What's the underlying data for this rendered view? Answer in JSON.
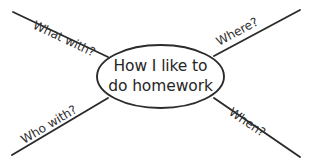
{
  "diagram": {
    "type": "mind-map",
    "title": "How I like to do homework",
    "background_color": "#ffffff",
    "stroke_color": "#2b2b2b",
    "text_color": "#262626",
    "center": {
      "shape": "ellipse",
      "line1": "How I like to",
      "line2": "do homework"
    },
    "branches": [
      {
        "id": "what-with",
        "label": "What with?",
        "position": "top-left"
      },
      {
        "id": "where",
        "label": "Where?",
        "position": "top-right"
      },
      {
        "id": "who-with",
        "label": "Who with?",
        "position": "bottom-left"
      },
      {
        "id": "when",
        "label": "When?",
        "position": "bottom-right"
      }
    ]
  }
}
